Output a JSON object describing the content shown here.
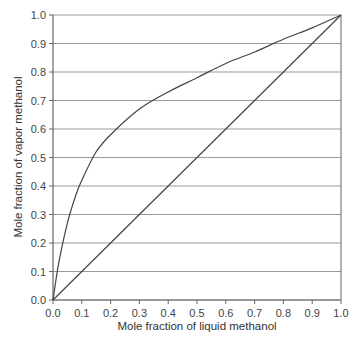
{
  "chart_data": {
    "type": "line",
    "title": "",
    "xlabel": "Mole fraction of liquid methanol",
    "ylabel": "Mole fraction of vapor methanol",
    "xlim": [
      0.0,
      1.0
    ],
    "ylim": [
      0.0,
      1.0
    ],
    "grid": "horizontal",
    "x_ticks": [
      "0.0",
      "0.1",
      "0.2",
      "0.3",
      "0.4",
      "0.5",
      "0.6",
      "0.7",
      "0.8",
      "0.9",
      "1.0"
    ],
    "y_ticks": [
      "0.0",
      "0.1",
      "0.2",
      "0.3",
      "0.4",
      "0.5",
      "0.6",
      "0.7",
      "0.8",
      "0.9",
      "1.0"
    ],
    "series": [
      {
        "name": "equilibrium curve",
        "x": [
          0.0,
          0.02,
          0.05,
          0.08,
          0.1,
          0.15,
          0.2,
          0.3,
          0.4,
          0.5,
          0.6,
          0.7,
          0.8,
          0.9,
          1.0
        ],
        "y": [
          0.0,
          0.13,
          0.27,
          0.37,
          0.42,
          0.52,
          0.58,
          0.67,
          0.73,
          0.78,
          0.83,
          0.87,
          0.915,
          0.955,
          1.0
        ]
      },
      {
        "name": "y = x diagonal",
        "x": [
          0.0,
          1.0
        ],
        "y": [
          0.0,
          1.0
        ]
      }
    ]
  }
}
